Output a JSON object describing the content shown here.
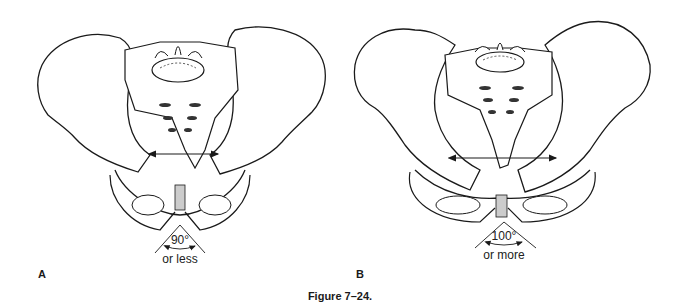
{
  "figure": {
    "caption": "Figure 7–24.",
    "panels": [
      {
        "label": "A",
        "description": "Narrower pelvis (anterior view), subpubic angle",
        "angle_value": "90°",
        "angle_qualifier": "or less"
      },
      {
        "label": "B",
        "description": "Wider pelvis (anterior view), subpubic angle",
        "angle_value": "100°",
        "angle_qualifier": "or more"
      }
    ]
  },
  "colors": {
    "line": "#1a1a1a",
    "bone_fill": "#ffffff",
    "shade": "#555555",
    "background": "#ffffff"
  }
}
